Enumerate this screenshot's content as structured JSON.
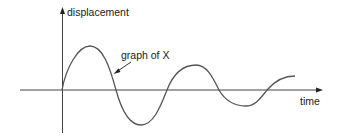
{
  "diagram": {
    "y_axis_label": "displacement",
    "x_axis_label": "time",
    "annotation": "graph of X",
    "curve": {
      "description": "damped oscillation starting at origin",
      "extrema": [
        {
          "type": "peak",
          "x": 90,
          "y": 46
        },
        {
          "type": "trough",
          "x": 141,
          "y": 125
        },
        {
          "type": "peak",
          "x": 196,
          "y": 65
        },
        {
          "type": "trough",
          "x": 246,
          "y": 106
        }
      ],
      "stroke_color": "#555555"
    },
    "axis_color": "#444444"
  }
}
